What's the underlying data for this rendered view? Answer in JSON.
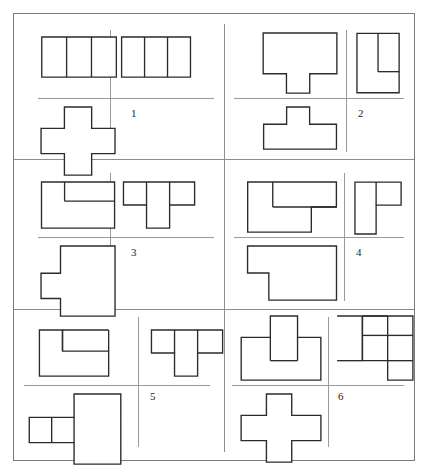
{
  "document": {
    "type": "orthographic-projection-exercise-sheet",
    "title": "",
    "sheet": {
      "width": 402,
      "height": 448,
      "border_color": "#7a7a7a",
      "background": "#ffffff"
    },
    "line_color": "#2b2b2b",
    "guide_color": "#9a9a9a",
    "grid": {
      "columns": 2,
      "rows": 3,
      "divider_x": 224,
      "divider_y": [
        159,
        309
      ]
    }
  },
  "cells": [
    {
      "number": "1",
      "label_position": "center-right",
      "views": {
        "front": {
          "name": "front-view",
          "description": "rectangle divided into three equal vertical panels",
          "outline": "0,0 78,0 78,42 0,42",
          "internal_lines": [
            [
              26,
              0,
              26,
              42
            ],
            [
              52,
              0,
              52,
              42
            ]
          ]
        },
        "side": {
          "name": "side-view",
          "description": "rectangle divided into three equal vertical panels",
          "outline": "0,0 72,0 72,42 0,42",
          "internal_lines": [
            [
              24,
              0,
              24,
              42
            ],
            [
              48,
              0,
              48,
              42
            ]
          ]
        },
        "top": {
          "name": "top-view",
          "description": "plus / cross shape",
          "outline": "24,0 52,0 52,22 76,22 76,48 52,48 52,70 24,70 24,48 0,48 0,22 24,22",
          "internal_lines": []
        }
      }
    },
    {
      "number": "2",
      "label_position": "center-right",
      "views": {
        "front": {
          "name": "front-view",
          "description": "inverted T / tee block with narrow foot below a wide slab",
          "outline": "0,0 76,0 76,42 48,42 48,62 24,62 24,42 0,42",
          "internal_lines": []
        },
        "side": {
          "name": "side-view",
          "description": "rectangle with an inner notch rectangle at upper right",
          "outline": "0,0 44,0 44,62 0,62",
          "internal_lines": [
            [
              22,
              0,
              22,
              40
            ],
            [
              22,
              40,
              44,
              40
            ]
          ]
        },
        "top": {
          "name": "top-view",
          "description": "tee shape, narrow tab on top of wide slab",
          "outline": "24,0 48,0 48,18 76,18 76,44 0,44 0,18 24,18",
          "internal_lines": []
        }
      }
    },
    {
      "number": "3",
      "label_position": "center-right",
      "views": {
        "front": {
          "name": "front-view",
          "description": "rectangle with an internal step rectangle at upper right",
          "outline": "0,0 76,0 76,48 0,48",
          "internal_lines": [
            [
              24,
              0,
              24,
              20
            ],
            [
              24,
              20,
              76,
              20
            ]
          ]
        },
        "side": {
          "name": "side-view",
          "description": "tee shape with wide top bar and a downward centre leg",
          "outline": "0,0 74,0 74,24 48,24 48,48 24,48 24,24 0,24",
          "internal_lines": [
            [
              24,
              0,
              24,
              24
            ],
            [
              48,
              0,
              48,
              24
            ]
          ]
        },
        "top": {
          "name": "top-view",
          "description": "rectangle with a rectangular tab protruding from the left side",
          "outline": "20,0 76,0 76,72 20,72 20,54 0,54 0,28 20,28",
          "internal_lines": []
        }
      }
    },
    {
      "number": "4",
      "label_position": "center-right",
      "views": {
        "front": {
          "name": "front-view",
          "description": "overlapping stepped rectangles forming a Z-like outline",
          "outline": "0,0 92,0 92,26 66,26 66,52 0,52",
          "internal_lines": [
            [
              26,
              0,
              26,
              26
            ],
            [
              26,
              26,
              92,
              26
            ]
          ]
        },
        "side": {
          "name": "side-view",
          "description": "L shape with the short arm at the upper right",
          "outline": "0,0 48,0 48,24 22,24 22,54 0,54",
          "internal_lines": [
            [
              22,
              0,
              22,
              24
            ]
          ]
        },
        "top": {
          "name": "top-view",
          "description": "rectangle with a rectangular notch cut from the lower left",
          "outline": "0,0 92,0 92,56 22,56 22,28 0,28",
          "internal_lines": []
        }
      }
    },
    {
      "number": "5",
      "label_position": "center-right",
      "views": {
        "front": {
          "name": "front-view",
          "description": "stepped Z outline with a raised block on the right",
          "outline": "0,0 24,0 24,22 72,22 72,48 0,48",
          "internal_lines": [
            [
              24,
              0,
              24,
              22
            ],
            [
              24,
              0,
              72,
              0
            ],
            [
              72,
              0,
              72,
              22
            ]
          ]
        },
        "side": {
          "name": "side-view",
          "description": "tee shape with wide top bar and a downward centre leg",
          "outline": "0,0 74,0 74,24 48,24 48,48 24,48 24,24 0,24",
          "internal_lines": [
            [
              24,
              0,
              24,
              24
            ],
            [
              48,
              0,
              48,
              24
            ]
          ]
        },
        "top": {
          "name": "top-view",
          "description": "tall rectangle with two small squares attached on the left",
          "outline": "46,0 94,0 94,72 46,72 46,50 0,50 0,24 46,24",
          "internal_lines": [
            [
              23,
              24,
              23,
              50
            ],
            [
              46,
              24,
              46,
              50
            ]
          ]
        }
      }
    },
    {
      "number": "6",
      "label_position": "center-right",
      "views": {
        "front": {
          "name": "front-view",
          "description": "wide block with a tall rectangular tower rising from the centre",
          "outline": "0,22 30,22 30,0 58,0 58,22 82,22 82,66 0,66",
          "internal_lines": [
            [
              30,
              22,
              30,
              46
            ],
            [
              58,
              22,
              58,
              46
            ],
            [
              30,
              46,
              58,
              46
            ]
          ]
        },
        "side": {
          "name": "side-view",
          "description": "three vertical bars, centre bar dropped lower, flanking bars raised",
          "outline": "0,0 26,0 26,46 52,46 52,66 78,66 78,0",
          "internal_lines": [
            [
              26,
              0,
              52,
              0
            ],
            [
              52,
              0,
              52,
              46
            ],
            [
              26,
              46,
              26,
              0
            ],
            [
              0,
              46,
              26,
              46
            ],
            [
              52,
              20,
              78,
              20
            ],
            [
              26,
              20,
              52,
              20
            ],
            [
              52,
              46,
              78,
              46
            ]
          ]
        },
        "top": {
          "name": "top-view",
          "description": "plus / cross shape with a wide horizontal bar",
          "outline": "26,0 52,0 52,22 82,22 82,48 52,48 52,70 26,70 26,48 0,48 0,22 26,22",
          "internal_lines": []
        }
      }
    }
  ]
}
